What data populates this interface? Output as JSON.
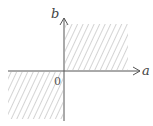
{
  "diagram": {
    "type": "coordinate-plane-region",
    "axes": {
      "x_label": "a",
      "y_label": "b",
      "origin_label": "0"
    },
    "shaded_regions": [
      {
        "name": "first-quadrant",
        "description": "a >= 0, b >= 0"
      },
      {
        "name": "third-quadrant",
        "description": "a <= 0, b <= 0"
      }
    ],
    "colors": {
      "axis": "#555555",
      "hatch": "#aaaaaa",
      "background": "#ffffff"
    }
  }
}
